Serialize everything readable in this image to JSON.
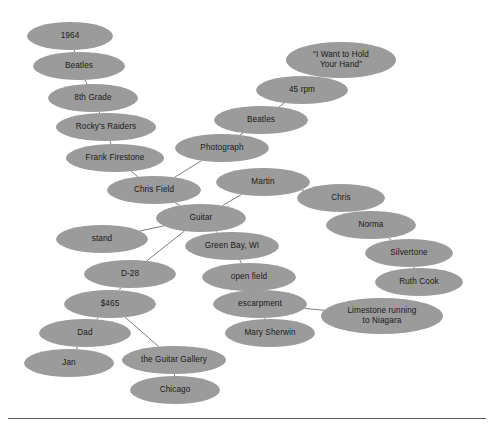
{
  "figure": {
    "kind": "concept-map",
    "background_color": "#ffffff",
    "node_fill_color": "#9b9b9b",
    "node_text_color": "#1a1a1a",
    "edge_color": "#6f6f6f",
    "rule_color": "#5d5d5d"
  },
  "chart_data": {
    "type": "diagram",
    "title": "",
    "nodes": [
      {
        "id": "n1",
        "label": "1964",
        "cx": 70,
        "cy": 36,
        "rx": 43,
        "ry": 14
      },
      {
        "id": "n2",
        "label": "Beatles",
        "cx": 79,
        "cy": 66,
        "rx": 46,
        "ry": 14
      },
      {
        "id": "n3",
        "label": "8th Grade",
        "cx": 93,
        "cy": 98,
        "rx": 45,
        "ry": 14
      },
      {
        "id": "n4",
        "label": "Rocky's Raiders",
        "cx": 106,
        "cy": 127,
        "rx": 50,
        "ry": 14
      },
      {
        "id": "n5",
        "label": "Frank Firestone",
        "cx": 115,
        "cy": 158,
        "rx": 49,
        "ry": 14
      },
      {
        "id": "n6",
        "label": "Chris Field",
        "cx": 154,
        "cy": 190,
        "rx": 47,
        "ry": 14
      },
      {
        "id": "n7",
        "label": "Guitar",
        "cx": 201,
        "cy": 218,
        "rx": 45,
        "ry": 14
      },
      {
        "id": "n8",
        "label": "stand",
        "cx": 102,
        "cy": 239,
        "rx": 46,
        "ry": 14
      },
      {
        "id": "n9",
        "label": "D-28",
        "cx": 130,
        "cy": 274,
        "rx": 46,
        "ry": 14
      },
      {
        "id": "n10",
        "label": "$465",
        "cx": 110,
        "cy": 304,
        "rx": 46,
        "ry": 14
      },
      {
        "id": "n11",
        "label": "Dad",
        "cx": 85,
        "cy": 333,
        "rx": 46,
        "ry": 14
      },
      {
        "id": "n12",
        "label": "Jan",
        "cx": 69,
        "cy": 363,
        "rx": 45,
        "ry": 14
      },
      {
        "id": "n13",
        "label": "the Guitar Gallery",
        "cx": 174,
        "cy": 360,
        "rx": 52,
        "ry": 14
      },
      {
        "id": "n14",
        "label": "Chicago",
        "cx": 175,
        "cy": 390,
        "rx": 45,
        "ry": 14
      },
      {
        "id": "n15",
        "label": "Photograph",
        "cx": 222,
        "cy": 148,
        "rx": 47,
        "ry": 14
      },
      {
        "id": "n16",
        "label": "Beatles",
        "cx": 261,
        "cy": 120,
        "rx": 47,
        "ry": 14
      },
      {
        "id": "n17",
        "label": "45 rpm",
        "cx": 302,
        "cy": 90,
        "rx": 46,
        "ry": 14
      },
      {
        "id": "n18",
        "label": "“I Want to Hold Your Hand”",
        "cx": 341,
        "cy": 60,
        "rx": 55,
        "ry": 18
      },
      {
        "id": "n19",
        "label": "Martin",
        "cx": 263,
        "cy": 182,
        "rx": 47,
        "ry": 14
      },
      {
        "id": "n20",
        "label": "Chris",
        "cx": 341,
        "cy": 198,
        "rx": 44,
        "ry": 14
      },
      {
        "id": "n21",
        "label": "Norma",
        "cx": 371,
        "cy": 225,
        "rx": 45,
        "ry": 14
      },
      {
        "id": "n22",
        "label": "Silvertone",
        "cx": 409,
        "cy": 253,
        "rx": 44,
        "ry": 14
      },
      {
        "id": "n23",
        "label": "Ruth Cook",
        "cx": 419,
        "cy": 282,
        "rx": 44,
        "ry": 14
      },
      {
        "id": "n24",
        "label": "Green Bay, WI",
        "cx": 232,
        "cy": 246,
        "rx": 47,
        "ry": 14
      },
      {
        "id": "n25",
        "label": "open field",
        "cx": 249,
        "cy": 277,
        "rx": 47,
        "ry": 14
      },
      {
        "id": "n26",
        "label": "escarpment",
        "cx": 260,
        "cy": 304,
        "rx": 47,
        "ry": 14
      },
      {
        "id": "n27",
        "label": "Mary Sherwin",
        "cx": 270,
        "cy": 333,
        "rx": 45,
        "ry": 14
      },
      {
        "id": "n28",
        "label": "Limestone running to Niagara",
        "cx": 382,
        "cy": 316,
        "rx": 61,
        "ry": 18
      }
    ],
    "edges": [
      {
        "from": "n1",
        "to": "n2"
      },
      {
        "from": "n2",
        "to": "n3"
      },
      {
        "from": "n3",
        "to": "n4"
      },
      {
        "from": "n4",
        "to": "n5"
      },
      {
        "from": "n5",
        "to": "n6"
      },
      {
        "from": "n6",
        "to": "n7"
      },
      {
        "from": "n6",
        "to": "n15"
      },
      {
        "from": "n15",
        "to": "n16"
      },
      {
        "from": "n16",
        "to": "n17"
      },
      {
        "from": "n17",
        "to": "n18"
      },
      {
        "from": "n7",
        "to": "n8"
      },
      {
        "from": "n7",
        "to": "n9"
      },
      {
        "from": "n7",
        "to": "n19"
      },
      {
        "from": "n7",
        "to": "n24"
      },
      {
        "from": "n19",
        "to": "n20"
      },
      {
        "from": "n20",
        "to": "n21"
      },
      {
        "from": "n21",
        "to": "n22"
      },
      {
        "from": "n22",
        "to": "n23"
      },
      {
        "from": "n9",
        "to": "n10"
      },
      {
        "from": "n10",
        "to": "n11"
      },
      {
        "from": "n10",
        "to": "n13"
      },
      {
        "from": "n11",
        "to": "n12"
      },
      {
        "from": "n13",
        "to": "n14"
      },
      {
        "from": "n24",
        "to": "n25"
      },
      {
        "from": "n25",
        "to": "n26"
      },
      {
        "from": "n26",
        "to": "n27"
      },
      {
        "from": "n26",
        "to": "n28"
      }
    ]
  }
}
